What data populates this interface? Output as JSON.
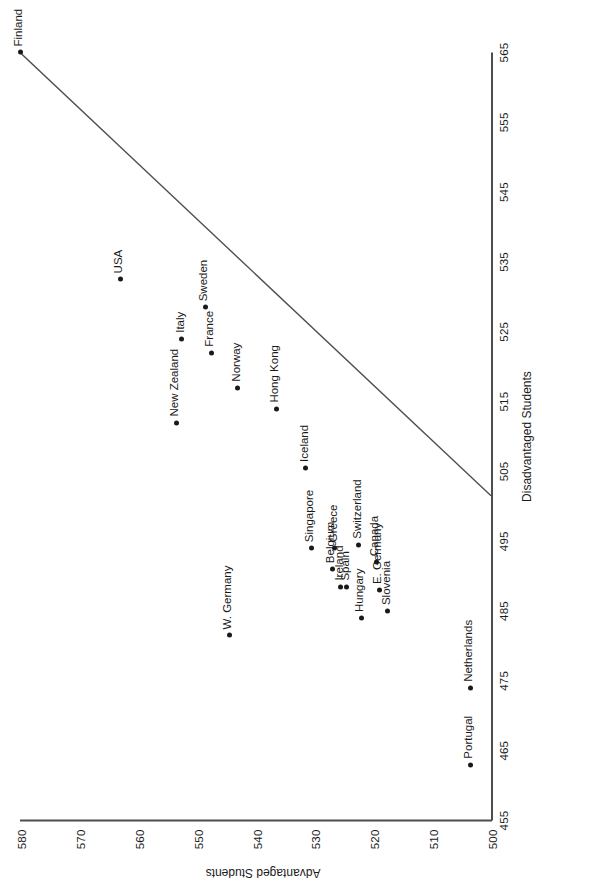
{
  "chart_data": {
    "type": "scatter",
    "title": "",
    "xlabel": "Disadvantaged Students",
    "ylabel": "Advantaged Students",
    "xlim": [
      455,
      565
    ],
    "ylim": [
      500,
      580
    ],
    "xticks": [
      455,
      465,
      475,
      485,
      495,
      505,
      515,
      525,
      535,
      545,
      555,
      565
    ],
    "yticks": [
      500,
      510,
      520,
      530,
      540,
      550,
      560,
      570,
      580
    ],
    "grid": false,
    "legend": null,
    "points": [
      {
        "label": "Finland",
        "x": 565.0,
        "y": 580.0
      },
      {
        "label": "USA",
        "x": 532.5,
        "y": 563.0
      },
      {
        "label": "New Zealand",
        "x": 512.0,
        "y": 553.5
      },
      {
        "label": "Italy",
        "x": 524.0,
        "y": 552.5
      },
      {
        "label": "Sweden",
        "x": 528.5,
        "y": 548.5
      },
      {
        "label": "France",
        "x": 522.0,
        "y": 547.5
      },
      {
        "label": "Norway",
        "x": 517.0,
        "y": 543.0
      },
      {
        "label": "W. Germany",
        "x": 481.5,
        "y": 544.5
      },
      {
        "label": "Hong Kong",
        "x": 514.0,
        "y": 536.5
      },
      {
        "label": "Iceland",
        "x": 505.5,
        "y": 531.5
      },
      {
        "label": "Singapore",
        "x": 494.0,
        "y": 530.5
      },
      {
        "label": "Belgium",
        "x": 491.0,
        "y": 527.0
      },
      {
        "label": "Greece",
        "x": 494.0,
        "y": 526.5
      },
      {
        "label": "Switzerland",
        "x": 494.5,
        "y": 522.5
      },
      {
        "label": "Ireland",
        "x": 488.5,
        "y": 525.5
      },
      {
        "label": "Spain",
        "x": 488.5,
        "y": 524.5
      },
      {
        "label": "Canada",
        "x": 492.0,
        "y": 519.5
      },
      {
        "label": "E. Germany",
        "x": 488.0,
        "y": 519.0
      },
      {
        "label": "Hungary",
        "x": 484.0,
        "y": 522.0
      },
      {
        "label": "Slovenia",
        "x": 485.0,
        "y": 517.5
      },
      {
        "label": "Netherlands",
        "x": 474.0,
        "y": 503.5
      },
      {
        "label": "Portugal",
        "x": 463.0,
        "y": 503.5
      }
    ],
    "trend_line": {
      "x0": 565.0,
      "y0": 580.0,
      "x1": 501.5,
      "y1": 500.0,
      "color": "#4d4d4d"
    }
  },
  "colors": {
    "point": "#1a1a1a",
    "axis": "#4d4d4d",
    "text": "#1a1a1a",
    "background": "#ffffff"
  }
}
